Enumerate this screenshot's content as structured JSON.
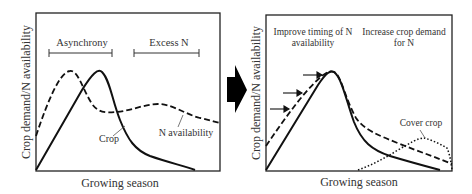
{
  "left_panel": {
    "y_axis_label": "Crop demand/N availability",
    "x_axis_label": "Growing season",
    "brackets": [
      {
        "label": "Asynchrony"
      },
      {
        "label": "Excess N"
      }
    ],
    "curve_labels": {
      "crop": "Crop",
      "n_availability": "N availability"
    }
  },
  "transition_arrow": {
    "icon": "right-arrow-icon"
  },
  "right_panel": {
    "y_axis_label": "Crop demand/N availability",
    "x_axis_label": "Growing season",
    "annotations": {
      "timing_line1": "Improve timing of N",
      "timing_line2": "availability",
      "demand_line1": "Increase crop demand",
      "demand_line2": "for N"
    },
    "curve_labels": {
      "cover_crop": "Cover crop"
    }
  },
  "legend_styles": {
    "crop": "solid",
    "n_availability": "dashed",
    "cover_crop": "dotted"
  }
}
